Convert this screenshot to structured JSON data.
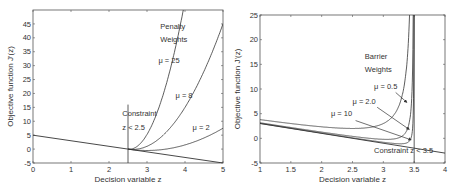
{
  "chart_data": [
    {
      "type": "line",
      "title": "",
      "xlabel": "Decision variable z",
      "ylabel": "Objective function J'(z)",
      "xlim": [
        0,
        5
      ],
      "ylim": [
        -5,
        50
      ],
      "xticks": [
        0,
        1,
        2,
        3,
        4,
        5
      ],
      "yticks": [
        -5,
        0,
        5,
        10,
        15,
        20,
        25,
        30,
        35,
        40,
        45
      ],
      "grid": false,
      "annotations": [
        {
          "text": "Penalty",
          "x": 3.35,
          "y": 43
        },
        {
          "text": "Weights",
          "x": 3.35,
          "y": 38.5
        },
        {
          "text": "μ = 25",
          "x": 3.3,
          "y": 31
        },
        {
          "text": "μ = 8",
          "x": 3.75,
          "y": 18.5
        },
        {
          "text": "μ = 2",
          "x": 4.2,
          "y": 7
        },
        {
          "text": "Constraint",
          "x": 2.35,
          "y": 12
        },
        {
          "text": "z < 2.5",
          "x": 2.35,
          "y": 7
        }
      ],
      "constraint_line": {
        "x": 2.5,
        "y_from": -5,
        "y_to": 16
      },
      "series": [
        {
          "name": "Objective",
          "x": [
            0,
            5
          ],
          "values": [
            5,
            -5
          ]
        },
        {
          "name": "μ = 25",
          "x": [
            2.5,
            2.75,
            3.0,
            3.25,
            3.5,
            3.75,
            4.0,
            4.06
          ],
          "values": [
            0,
            1.06,
            5.25,
            12.56,
            23.0,
            36.56,
            53.25,
            60.0
          ]
        },
        {
          "name": "μ = 8",
          "x": [
            2.5,
            3.0,
            3.5,
            4.0,
            4.5,
            5.0
          ],
          "values": [
            0,
            1.0,
            6.0,
            15.0,
            28.0,
            45.0
          ]
        },
        {
          "name": "μ = 2",
          "x": [
            2.5,
            3.0,
            3.5,
            4.0,
            4.5,
            5.0
          ],
          "values": [
            0,
            -0.5,
            0,
            1.5,
            4.0,
            7.5
          ]
        }
      ]
    },
    {
      "type": "line",
      "title": "",
      "xlabel": "Decision variable z",
      "ylabel": "Objective function J'(z)",
      "xlim": [
        1,
        4
      ],
      "ylim": [
        -5,
        25
      ],
      "xticks": [
        1,
        1.5,
        2,
        2.5,
        3,
        3.5,
        4
      ],
      "yticks": [
        -5,
        0,
        5,
        10,
        15,
        20,
        25
      ],
      "grid": false,
      "annotations": [
        {
          "text": "Barrier",
          "x": 2.7,
          "y": 16
        },
        {
          "text": "Weights",
          "x": 2.7,
          "y": 13.5
        },
        {
          "text": "μ = 0.5",
          "x": 2.85,
          "y": 10
        },
        {
          "text": "μ = 2.0",
          "x": 2.5,
          "y": 7
        },
        {
          "text": "μ = 10",
          "x": 2.15,
          "y": 4.5
        },
        {
          "text": "Constraint  z < 3.5",
          "x": 2.85,
          "y": -3
        }
      ],
      "constraint_line": {
        "x": 3.5,
        "y_from": -5,
        "y_to": 25
      },
      "series": [
        {
          "name": "Objective",
          "x": [
            1,
            4
          ],
          "values": [
            3,
            -3
          ]
        },
        {
          "name": "μ = 10",
          "x": [
            1,
            1.5,
            2,
            2.5,
            3,
            3.25,
            3.4,
            3.45
          ],
          "values": [
            3.8,
            3.0,
            2.33,
            2.0,
            3.0,
            5.5,
            13.2,
            33.1
          ]
        },
        {
          "name": "μ = 2.0",
          "x": [
            1,
            1.5,
            2,
            2.5,
            3,
            3.3,
            3.4,
            3.45,
            3.48
          ],
          "values": [
            3.16,
            2.2,
            1.27,
            0.4,
            -0.2,
            0.4,
            2.2,
            6.1,
            13.0
          ]
        },
        {
          "name": "μ = 0.5",
          "x": [
            1,
            2,
            3,
            3.3,
            3.4,
            3.45,
            3.48,
            3.49
          ],
          "values": [
            3.04,
            1.07,
            -0.8,
            -1.1,
            -0.8,
            0.1,
            2.04,
            5.0
          ]
        }
      ]
    }
  ]
}
